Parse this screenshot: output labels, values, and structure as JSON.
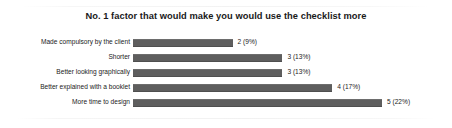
{
  "chart_data": {
    "type": "bar",
    "orientation": "horizontal",
    "title": "No. 1 factor that would make you would use the checklist more",
    "xlabel": "",
    "ylabel": "",
    "grid": false,
    "legend": null,
    "xlim": [
      0,
      5
    ],
    "categories": [
      "Made compulsory by the client",
      "Shorter",
      "Better looking graphically",
      "Better explained with a booklet",
      "More time to design"
    ],
    "values": [
      2,
      3,
      3,
      4,
      5
    ],
    "percents": [
      "9%",
      "13%",
      "13%",
      "17%",
      "22%"
    ],
    "data_labels": [
      "2 (9%)",
      "3 (13%)",
      "3 (13%)",
      "4 (17%)",
      "5 (22%)"
    ],
    "bar_color": "#5e5e5e",
    "background": "#ffffff"
  }
}
